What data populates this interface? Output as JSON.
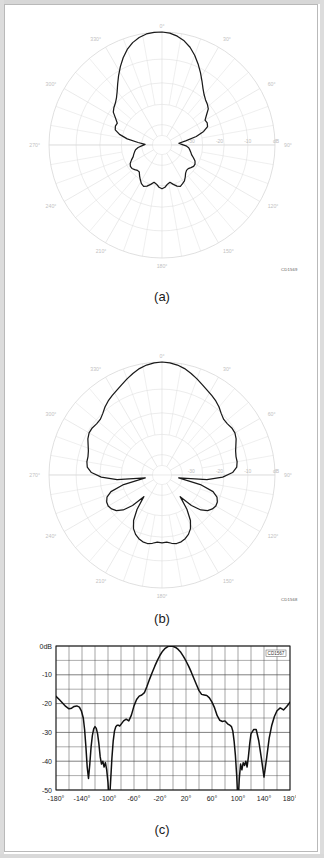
{
  "page": {
    "background": "#ffffff",
    "frame_color": "#b9b9b9"
  },
  "figure": {
    "panels": [
      {
        "id": "a",
        "caption": "(a)",
        "cd_tag": "CD1569"
      },
      {
        "id": "b",
        "caption": "(b)",
        "cd_tag": "CD1568"
      },
      {
        "id": "c",
        "caption": "(c)",
        "cd_tag": "CD1567"
      }
    ]
  },
  "polar_common": {
    "angle_labels": [
      "0°",
      "30°",
      "60°",
      "90°",
      "120°",
      "150°",
      "180°",
      "210°",
      "240°",
      "270°",
      "300°",
      "330°"
    ],
    "radial_labels": [
      "-30",
      "-20",
      "-10",
      "dB"
    ],
    "grid_color": "#d8d8d8",
    "trace_color": "#1a1a1a"
  },
  "chart_data": [
    {
      "type": "line",
      "id": "a",
      "title": "",
      "subtitle": "(a)",
      "coordinate_system": "polar",
      "xlabel": "Azimuth angle (degrees)",
      "ylabel": "Relative level (dB)",
      "angle_ticks": [
        0,
        30,
        60,
        90,
        120,
        150,
        180,
        210,
        240,
        270,
        300,
        330
      ],
      "angle_tick_labels": [
        "0°",
        "30°",
        "60°",
        "90°",
        "120°",
        "150°",
        "180°",
        "210°",
        "240°",
        "270°",
        "300°",
        "330°"
      ],
      "radial_ticks": [
        -40,
        -30,
        -20,
        -10,
        0
      ],
      "radial_tick_labels": [
        "",
        "-30",
        "-20",
        "-10",
        "dB"
      ],
      "rlim": [
        -40,
        0
      ],
      "grid": true,
      "legend": "none",
      "annotations": [
        "CD1569"
      ],
      "series": [
        {
          "name": "Pattern (a)",
          "theta": [
            0,
            4,
            8,
            12,
            16,
            20,
            24,
            28,
            32,
            36,
            40,
            44,
            48,
            52,
            56,
            60,
            64,
            68,
            72,
            76,
            80,
            84,
            88,
            92,
            96,
            100,
            104,
            108,
            112,
            116,
            120,
            124,
            128,
            132,
            136,
            140,
            144,
            148,
            152,
            156,
            160,
            164,
            168,
            172,
            176,
            180,
            184,
            188,
            192,
            196,
            200,
            204,
            208,
            212,
            216,
            220,
            224,
            228,
            232,
            236,
            240,
            244,
            248,
            252,
            256,
            260,
            264,
            268,
            272,
            276,
            280,
            284,
            288,
            292,
            296,
            300,
            304,
            308,
            312,
            316,
            320,
            324,
            328,
            332,
            336,
            340,
            344,
            348,
            352,
            356
          ],
          "r": [
            0,
            -0.3,
            -1.1,
            -2.3,
            -4.0,
            -6.2,
            -8.6,
            -11.0,
            -13.3,
            -15.3,
            -16.8,
            -17.8,
            -18.4,
            -19.2,
            -21.0,
            -22.4,
            -22.2,
            -22.6,
            -24.5,
            -27.5,
            -31.5,
            -34.0,
            -33.0,
            -31.5,
            -30.5,
            -30.0,
            -29.5,
            -29.0,
            -28.0,
            -27.0,
            -26.5,
            -26.5,
            -27.0,
            -27.5,
            -27.5,
            -27.0,
            -26.0,
            -25.0,
            -24.5,
            -24.0,
            -24.5,
            -25.5,
            -26.5,
            -26.0,
            -25.0,
            -24.5,
            -25.0,
            -26.0,
            -26.5,
            -25.5,
            -24.5,
            -24.0,
            -24.5,
            -25.5,
            -26.5,
            -27.5,
            -27.5,
            -27.0,
            -26.5,
            -26.5,
            -27.0,
            -28.0,
            -29.0,
            -29.5,
            -30.0,
            -30.5,
            -31.5,
            -33.0,
            -34.0,
            -31.5,
            -27.5,
            -24.5,
            -22.6,
            -22.2,
            -22.4,
            -21.0,
            -19.2,
            -18.4,
            -17.8,
            -16.8,
            -15.3,
            -13.3,
            -11.0,
            -8.6,
            -6.2,
            -4.0,
            -2.3,
            -1.1,
            -0.3,
            0.0
          ]
        }
      ]
    },
    {
      "type": "line",
      "id": "b",
      "title": "",
      "subtitle": "(b)",
      "coordinate_system": "polar",
      "xlabel": "Azimuth angle (degrees)",
      "ylabel": "Relative level (dB)",
      "angle_ticks": [
        0,
        30,
        60,
        90,
        120,
        150,
        180,
        210,
        240,
        270,
        300,
        330
      ],
      "angle_tick_labels": [
        "0°",
        "30°",
        "60°",
        "90°",
        "120°",
        "150°",
        "180°",
        "210°",
        "240°",
        "270°",
        "300°",
        "330°"
      ],
      "radial_ticks": [
        -40,
        -30,
        -20,
        -10,
        0
      ],
      "radial_tick_labels": [
        "",
        "-30",
        "-20",
        "-10",
        "dB"
      ],
      "rlim": [
        -40,
        0
      ],
      "grid": true,
      "legend": "none",
      "annotations": [
        "CD1568"
      ],
      "series": [
        {
          "name": "Pattern (b)",
          "theta": [
            0,
            4,
            8,
            12,
            16,
            20,
            24,
            28,
            32,
            36,
            40,
            44,
            48,
            52,
            56,
            60,
            64,
            68,
            72,
            76,
            80,
            84,
            88,
            92,
            96,
            100,
            104,
            108,
            112,
            116,
            120,
            124,
            128,
            132,
            136,
            140,
            144,
            148,
            152,
            156,
            160,
            164,
            168,
            172,
            176,
            180,
            184,
            188,
            192,
            196,
            200,
            204,
            208,
            212,
            216,
            220,
            224,
            228,
            232,
            236,
            240,
            244,
            248,
            252,
            256,
            260,
            264,
            268,
            272,
            276,
            280,
            284,
            288,
            292,
            296,
            300,
            304,
            308,
            312,
            316,
            320,
            324,
            328,
            332,
            336,
            340,
            344,
            348,
            352,
            356
          ],
          "r": [
            0,
            -0.2,
            -0.7,
            -1.5,
            -2.6,
            -3.8,
            -5.0,
            -6.0,
            -6.8,
            -7.6,
            -8.6,
            -9.8,
            -10.6,
            -10.6,
            -10.2,
            -10.2,
            -10.8,
            -11.8,
            -12.6,
            -13.0,
            -13.0,
            -13.4,
            -15.0,
            -18.5,
            -24.0,
            -34.0,
            -26.0,
            -21.0,
            -19.0,
            -18.2,
            -18.0,
            -18.5,
            -19.5,
            -21.5,
            -25.0,
            -30.0,
            -25.0,
            -21.0,
            -18.5,
            -17.0,
            -16.0,
            -15.4,
            -15.2,
            -15.6,
            -16.2,
            -16.0,
            -16.2,
            -15.6,
            -15.2,
            -15.4,
            -16.0,
            -17.0,
            -18.5,
            -21.0,
            -25.0,
            -30.0,
            -25.0,
            -21.5,
            -19.5,
            -18.5,
            -18.0,
            -18.2,
            -19.0,
            -21.0,
            -26.0,
            -34.0,
            -24.0,
            -18.5,
            -15.0,
            -13.4,
            -13.0,
            -13.0,
            -12.6,
            -11.8,
            -10.8,
            -10.2,
            -10.2,
            -10.6,
            -10.6,
            -9.8,
            -8.6,
            -7.6,
            -6.8,
            -6.0,
            -5.0,
            -3.8,
            -2.6,
            -1.5,
            -0.7,
            -0.2
          ]
        }
      ]
    },
    {
      "type": "line",
      "id": "c",
      "title": "",
      "subtitle": "(c)",
      "coordinate_system": "cartesian",
      "xlabel": "",
      "ylabel": "",
      "xlim": [
        -180,
        180
      ],
      "ylim": [
        -50,
        0
      ],
      "xticks": [
        -180,
        -140,
        -100,
        -60,
        -20,
        20,
        60,
        100,
        140,
        180
      ],
      "xtick_labels": [
        "-180°",
        "-140°",
        "-100°",
        "-60°",
        "-20°",
        "20°",
        "60°",
        "100°",
        "140°",
        "180°"
      ],
      "yticks": [
        0,
        -10,
        -20,
        -30,
        -40,
        -50
      ],
      "ytick_labels": [
        "0dB",
        "-10",
        "-20",
        "-30",
        "-40",
        "-50"
      ],
      "grid": true,
      "grid_minor_x": 20,
      "grid_minor_y": 5,
      "legend": "none",
      "annotations": [
        "CD1567"
      ],
      "series": [
        {
          "name": "Pattern (c)",
          "x": [
            -180,
            -175,
            -170,
            -165,
            -160,
            -156,
            -152,
            -148,
            -144,
            -141,
            -138,
            -136,
            -134,
            -132,
            -130,
            -128,
            -126,
            -124,
            -122,
            -120,
            -118,
            -116,
            -114,
            -112,
            -110,
            -108,
            -106,
            -104,
            -102,
            -100,
            -98,
            -96,
            -94,
            -92,
            -90,
            -88,
            -86,
            -84,
            -82,
            -80,
            -76,
            -72,
            -68,
            -64,
            -60,
            -56,
            -52,
            -48,
            -44,
            -40,
            -36,
            -32,
            -28,
            -24,
            -20,
            -16,
            -12,
            -8,
            -4,
            0,
            4,
            8,
            12,
            16,
            20,
            24,
            28,
            32,
            36,
            40,
            44,
            48,
            52,
            56,
            60,
            64,
            68,
            72,
            76,
            80,
            84,
            88,
            90,
            92,
            94,
            96,
            98,
            100,
            102,
            104,
            106,
            108,
            110,
            112,
            114,
            116,
            118,
            120,
            124,
            128,
            132,
            136,
            140,
            144,
            148,
            152,
            156,
            160,
            165,
            170,
            175,
            180
          ],
          "y": [
            -17.5,
            -18.6,
            -19.8,
            -21.0,
            -21.8,
            -21.6,
            -21.0,
            -20.8,
            -21.2,
            -22.5,
            -25.0,
            -29.0,
            -35.0,
            -42.0,
            -46.0,
            -41.0,
            -35.0,
            -31.0,
            -28.8,
            -28.0,
            -28.6,
            -30.5,
            -34.0,
            -38.5,
            -41.0,
            -40.0,
            -42.0,
            -40.5,
            -43.0,
            -47.5,
            -55.0,
            -47.0,
            -39.0,
            -33.0,
            -29.5,
            -28.0,
            -27.5,
            -27.5,
            -27.8,
            -27.2,
            -26.0,
            -25.4,
            -26.0,
            -24.0,
            -20.8,
            -18.6,
            -17.4,
            -17.0,
            -16.2,
            -14.0,
            -11.5,
            -9.2,
            -7.0,
            -5.0,
            -3.2,
            -1.8,
            -0.8,
            -0.2,
            0.0,
            -0.1,
            -0.5,
            -1.2,
            -2.2,
            -3.6,
            -5.2,
            -7.0,
            -9.0,
            -11.2,
            -13.4,
            -15.5,
            -16.8,
            -17.0,
            -17.2,
            -18.0,
            -19.5,
            -21.5,
            -24.2,
            -25.8,
            -26.2,
            -26.0,
            -27.0,
            -27.6,
            -28.0,
            -29.5,
            -33.0,
            -38.0,
            -45.0,
            -55.0,
            -46.0,
            -41.0,
            -43.0,
            -40.5,
            -41.5,
            -40.0,
            -42.0,
            -38.5,
            -34.0,
            -30.5,
            -29.0,
            -29.0,
            -33.0,
            -39.0,
            -45.5,
            -39.0,
            -32.0,
            -27.5,
            -24.5,
            -22.5,
            -21.5,
            -22.2,
            -21.0,
            -19.5,
            -18.2,
            -17.5
          ]
        }
      ]
    }
  ]
}
